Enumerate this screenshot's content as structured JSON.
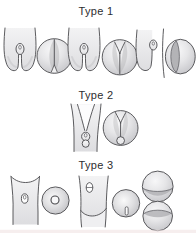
{
  "figure": {
    "labels": [
      {
        "id": "type1",
        "text": "Type 1"
      },
      {
        "id": "type2",
        "text": "Type 2"
      },
      {
        "id": "type3",
        "text": "Type 3"
      }
    ],
    "colors": {
      "background": "#ffffff",
      "outline": "#4a4a4d",
      "fill_light": "#f3f3f4",
      "fill_mid": "#dedee1",
      "shade": "#b3b3b6",
      "text": "#2d2d2f",
      "bottom_strip": "#f0e3e3"
    },
    "rows": [
      {
        "label": "Type 1",
        "panels": [
          "bifid-frontal-view",
          "axial-sphere-bottom-cleft",
          "bifid-frontal-view",
          "axial-sphere-top-cleft",
          "hemi-lobe-frontal-view",
          "axial-sphere-left-crescent"
        ]
      },
      {
        "label": "Type 2",
        "panels": [
          "deep-cleft-frontal-view",
          "axial-sphere-cleft-with-nodule"
        ]
      },
      {
        "label": "Type 3",
        "panels": [
          "column-frontal-view-ring",
          "axial-sphere-central-ring",
          "column-frontal-view-slit",
          "axial-sphere-vertical-slit",
          "stacked-spheres-view"
        ]
      }
    ]
  }
}
